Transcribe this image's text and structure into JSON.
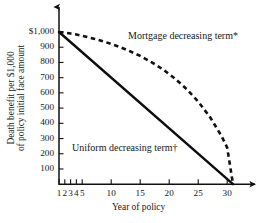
{
  "chart_data": {
    "type": "line",
    "title": "",
    "xlabel": "Year of policy",
    "ylabel_line1": "Death benefit per $1,000",
    "ylabel_line2": "of policy initial face amount",
    "xlim": [
      1,
      31
    ],
    "ylim": [
      0,
      1000
    ],
    "grid": false,
    "legend_position": "inline-annotations",
    "x_ticks": [
      1,
      2,
      3,
      4,
      5,
      10,
      15,
      20,
      25,
      30
    ],
    "x_tick_labels": [
      "1",
      "2",
      "3",
      "4",
      "5",
      "10",
      "15",
      "20",
      "25",
      "30"
    ],
    "y_ticks": [
      100,
      200,
      300,
      400,
      500,
      600,
      700,
      800,
      900,
      1000
    ],
    "y_tick_labels": [
      "100",
      "200",
      "300",
      "400",
      "500",
      "600",
      "700",
      "800",
      "900",
      "$1,000"
    ],
    "series": [
      {
        "name": "Mortgage decreasing term*",
        "style": "dashed",
        "color": "#111111",
        "x": [
          1,
          2,
          3,
          4,
          5,
          7,
          9,
          11,
          13,
          15,
          17,
          19,
          21,
          23,
          25,
          27,
          29,
          30,
          31
        ],
        "values": [
          1000,
          996,
          990,
          983,
          975,
          956,
          934,
          908,
          878,
          843,
          801,
          752,
          694,
          625,
          543,
          443,
          318,
          240,
          0
        ]
      },
      {
        "name": "Uniform decreasing term†",
        "style": "solid",
        "color": "#0d0d0d",
        "x": [
          1,
          31
        ],
        "values": [
          1000,
          0
        ]
      }
    ],
    "annotations": [
      {
        "id": "mortgage-label",
        "text": "Mortgage decreasing term*",
        "x_px": 128,
        "y_px": 31
      },
      {
        "id": "uniform-label",
        "text": "Uniform decreasing term†",
        "x_px": 72,
        "y_px": 143
      }
    ],
    "footnote_partial": ""
  },
  "axes": {
    "x_title": "Year of policy",
    "y_title_line1": "Death benefit per $1,000",
    "y_title_line2": "of policy initial face amount"
  }
}
